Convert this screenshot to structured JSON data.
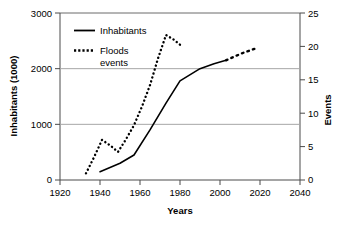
{
  "chart_data": {
    "type": "line",
    "title": "",
    "subtitle": "",
    "xlabel": "Years",
    "ylabel": "Inhabitants (1000)",
    "y2label": "Events",
    "xlim": [
      1920,
      2040
    ],
    "ylim": [
      0,
      3000
    ],
    "y2lim": [
      0,
      25
    ],
    "xticks": [
      "1920",
      "1940",
      "1960",
      "1980",
      "2000",
      "2020",
      "2040"
    ],
    "xtick_values": [
      1920,
      1940,
      1960,
      1980,
      2000,
      2020,
      2040
    ],
    "yticks": [
      "0",
      "1000",
      "2000",
      "3000"
    ],
    "ytick_values": [
      0,
      1000,
      2000,
      3000
    ],
    "y2ticks": [
      "0",
      "5",
      "10",
      "15",
      "20",
      "25"
    ],
    "y2tick_values": [
      0,
      5,
      10,
      15,
      20,
      25
    ],
    "grid": "horizontal-left-axis",
    "legend_position": "top-left-inside",
    "series": [
      {
        "name": "Inhabitants",
        "axis": "left",
        "style": "solid",
        "color": "#000000",
        "x": [
          1940,
          1950,
          1957,
          1965,
          1973,
          1980,
          1990,
          1997,
          2003
        ],
        "values": [
          150,
          300,
          450,
          900,
          1380,
          1780,
          2000,
          2090,
          2150
        ]
      },
      {
        "name": "Inhabitants projection",
        "axis": "left",
        "style": "dotted",
        "color": "#000000",
        "x": [
          2003,
          2008,
          2012,
          2016,
          2019
        ],
        "values": [
          2150,
          2230,
          2290,
          2340,
          2380
        ]
      },
      {
        "name": "Floods events",
        "axis": "right",
        "style": "dotted",
        "color": "#000000",
        "x": [
          1933,
          1937,
          1941,
          1945,
          1949,
          1953,
          1957,
          1961,
          1965,
          1969,
          1973,
          1977,
          1981
        ],
        "values": [
          1.0,
          3.4,
          6.0,
          5.2,
          4.2,
          6.1,
          8.2,
          11.0,
          14.2,
          18.2,
          21.7,
          21.0,
          20.0
        ]
      }
    ],
    "legend": [
      {
        "label": "Inhabitants",
        "style": "solid"
      },
      {
        "label": "Floods",
        "label2": "events",
        "style": "dotted"
      }
    ]
  },
  "legend": {
    "inhabitants_label": "Inhabitants",
    "floods_label": "Floods",
    "events_label": "events"
  },
  "axes": {
    "x_title": "Years",
    "y_title": "Inhabitants (1000)",
    "y2_title": "Events",
    "x_tick_0": "1920",
    "x_tick_1": "1940",
    "x_tick_2": "1960",
    "x_tick_3": "1980",
    "x_tick_4": "2000",
    "x_tick_5": "2020",
    "x_tick_6": "2040",
    "y_tick_0": "0",
    "y_tick_1": "1000",
    "y_tick_2": "2000",
    "y_tick_3": "3000",
    "y2_tick_0": "0",
    "y2_tick_1": "5",
    "y2_tick_2": "10",
    "y2_tick_3": "15",
    "y2_tick_4": "20",
    "y2_tick_5": "25"
  },
  "colors": {
    "ink": "#000000",
    "grid": "#9a9a9a",
    "frame": "#5a5a5a",
    "background": "#ffffff"
  }
}
